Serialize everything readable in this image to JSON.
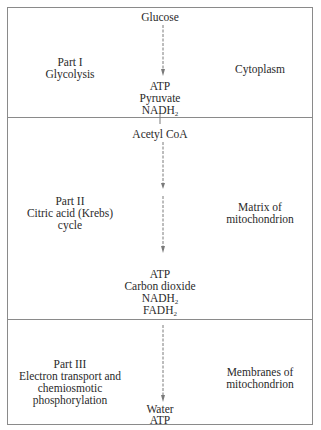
{
  "diagram": {
    "sections": [
      {
        "part_label": "Part I",
        "part_name": "Glycolysis",
        "location": "Cytoplasm",
        "input": "Glucose",
        "outputs": [
          "ATP",
          "Pyruvate",
          "NADH2"
        ]
      },
      {
        "part_label": "Part II",
        "part_name_lines": [
          "Citric acid (Krebs)",
          "cycle"
        ],
        "location_lines": [
          "Matrix of",
          "mitochondrion"
        ],
        "input": "Acetyl CoA",
        "outputs": [
          "ATP",
          "Carbon dioxide",
          "NADH2",
          "FADH2"
        ]
      },
      {
        "part_label": "Part III",
        "part_name_lines": [
          "Electron transport and",
          "chemiosmotic",
          "phosphorylation"
        ],
        "location_lines": [
          "Membranes of",
          "mitochondrion"
        ],
        "outputs": [
          "Water",
          "ATP"
        ]
      }
    ],
    "colors": {
      "border": "#8a8a8a",
      "text": "#2a2a2a",
      "arrow": "#7a7a7a"
    }
  },
  "text": {
    "s1_input": "Glucose",
    "s1_part": "Part I",
    "s1_name": "Glycolysis",
    "s1_loc": "Cytoplasm",
    "s1_out1": "ATP",
    "s1_out2": "Pyruvate",
    "s1_out3": "NADH",
    "s1_out3_sub": "2",
    "s2_input": "Acetyl CoA",
    "s2_part": "Part II",
    "s2_name1": "Citric acid (Krebs)",
    "s2_name2": "cycle",
    "s2_loc1": "Matrix of",
    "s2_loc2": "mitochondrion",
    "s2_out1": "ATP",
    "s2_out2": "Carbon dioxide",
    "s2_out3": "NADH",
    "s2_out3_sub": "2",
    "s2_out4": "FADH",
    "s2_out4_sub": "2",
    "s3_part": "Part III",
    "s3_name1": "Electron transport and",
    "s3_name2": "chemiosmotic",
    "s3_name3": "phosphorylation",
    "s3_loc1": "Membranes of",
    "s3_loc2": "mitochondrion",
    "s3_out1": "Water",
    "s3_out2": "ATP"
  }
}
